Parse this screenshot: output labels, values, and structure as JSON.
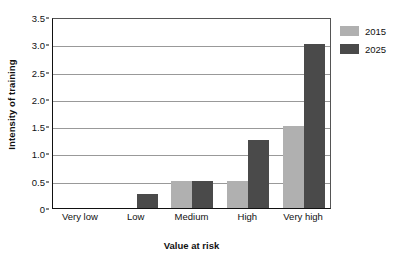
{
  "chart_data": {
    "type": "bar",
    "title": "",
    "xlabel": "Value at risk",
    "ylabel": "Intensity of training",
    "categories": [
      "Very low",
      "Low",
      "Medium",
      "High",
      "Very high"
    ],
    "series": [
      {
        "name": "2015",
        "color": "#b0b0b0",
        "values": [
          0,
          0,
          0.5,
          0.5,
          1.5
        ]
      },
      {
        "name": "2025",
        "color": "#4a4a4a",
        "values": [
          0,
          0.25,
          0.5,
          1.25,
          3.0
        ]
      }
    ],
    "ylim": [
      0,
      3.5
    ],
    "y_ticks": [
      "0",
      "0.5",
      "1.0",
      "1.5",
      "2.0",
      "2.5",
      "3.0",
      "3.5"
    ],
    "y_tick_values": [
      0,
      0.5,
      1.0,
      1.5,
      2.0,
      2.5,
      3.0,
      3.5
    ],
    "grid": "horizontal",
    "legend_position": "right",
    "legend_entries": [
      "2015",
      "2025"
    ]
  }
}
